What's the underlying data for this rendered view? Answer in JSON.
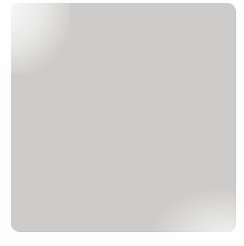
{
  "diagram": {
    "kind": "go-board-diagram",
    "board": {
      "size_cols": 9,
      "size_rows": 9,
      "background_color": "#cdcccb",
      "line_color": "#3a3a3a",
      "edge_line_color": "#262626",
      "show_star_points": false,
      "grid_spacing_px": 26,
      "origin_x_px": 22,
      "origin_y_px": 6
    },
    "colors": {
      "black_stone": "#141414",
      "white_stone": "#f4f3f1",
      "stone_outline": "#1b1b1b",
      "label_text": "#ffffff",
      "marker": "#1b1b1b",
      "paper": "#fdfdfd"
    },
    "stone_radius_px": 13,
    "stones": [
      {
        "id": "b-d3",
        "color": "black",
        "col": 3,
        "row": 5,
        "label": "",
        "marker": "none"
      },
      {
        "id": "b-e3",
        "color": "black",
        "col": 4,
        "row": 5,
        "label": "",
        "marker": "none"
      },
      {
        "id": "b-c4",
        "color": "black",
        "col": 2,
        "row": 6,
        "label": "",
        "marker": "none"
      },
      {
        "id": "w-d4",
        "color": "white",
        "col": 3,
        "row": 6,
        "label": "",
        "marker": "triangle"
      },
      {
        "id": "w-e4",
        "color": "white",
        "col": 4,
        "row": 6,
        "label": "",
        "marker": "triangle"
      },
      {
        "id": "b-f4",
        "color": "black",
        "col": 5,
        "row": 6,
        "label": "",
        "marker": "none"
      },
      {
        "id": "w-g4",
        "color": "white",
        "col": 6,
        "row": 6,
        "label": "",
        "marker": "none"
      },
      {
        "id": "b-d5",
        "color": "black",
        "col": 3,
        "row": 7,
        "label": "",
        "marker": "none"
      },
      {
        "id": "w-e5",
        "color": "white",
        "col": 4,
        "row": 7,
        "label": "",
        "marker": "triangle"
      },
      {
        "id": "b-f5",
        "color": "black",
        "col": 5,
        "row": 7,
        "label": "1",
        "marker": "none"
      }
    ],
    "move_labels": [
      "1"
    ],
    "marker_legend": {
      "triangle": "triangle-marked white stones"
    }
  }
}
